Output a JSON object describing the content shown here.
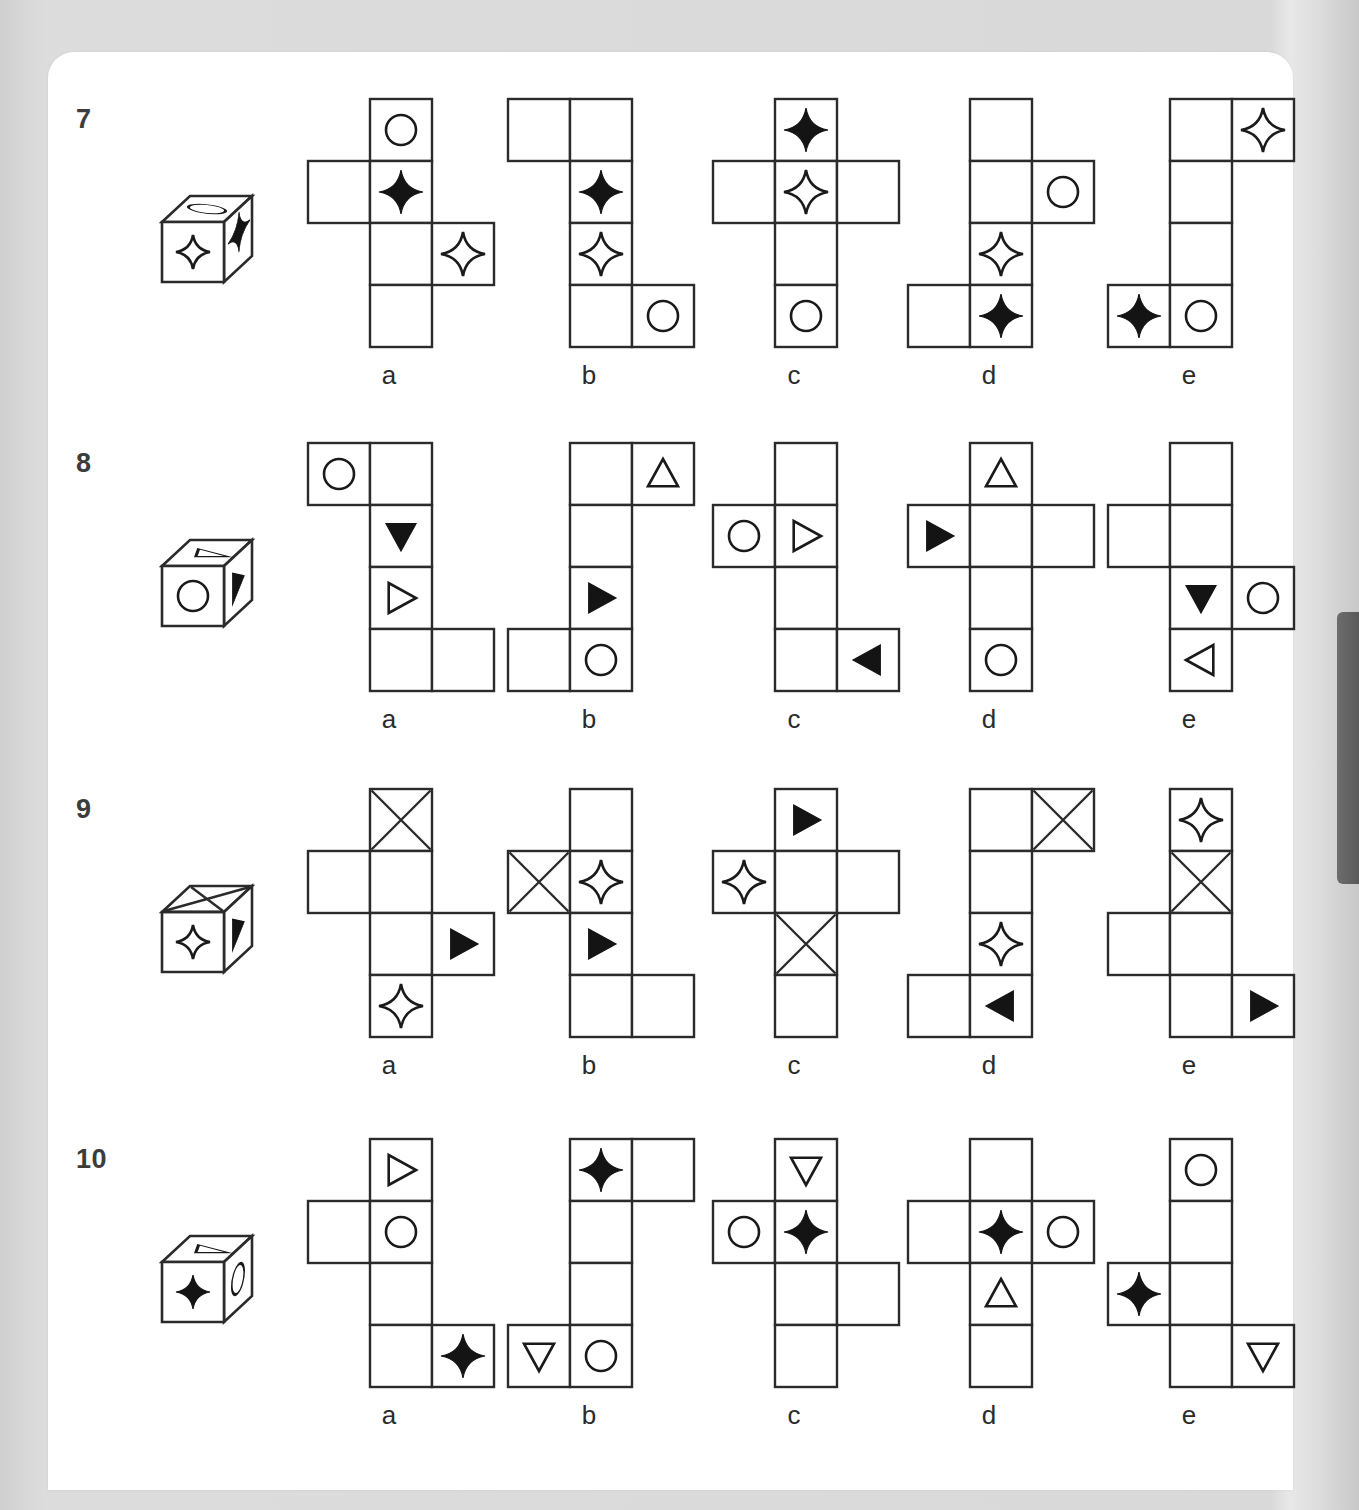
{
  "page": {
    "background_color": "#d6d6d6",
    "card_color": "#ffffff",
    "tab_color": "#636363",
    "ink_color": "#1a1a1a"
  },
  "puzzle": {
    "type": "cube-net-matching",
    "option_labels": [
      "a",
      "b",
      "c",
      "d",
      "e"
    ],
    "cell_size": 62,
    "rows": [
      {
        "number": "7",
        "cube": {
          "top_face": "circle",
          "front_face": "star-open",
          "right_face": "star-filled"
        },
        "options": [
          {
            "label": "a",
            "left_col": [
              {
                "row": 2,
                "glyph": "empty"
              }
            ],
            "mid_col": [
              "circle",
              "star-filled",
              "empty",
              "empty"
            ],
            "right_col": [
              {
                "row": 3,
                "glyph": "star-open"
              }
            ]
          },
          {
            "label": "b",
            "left_col": [
              {
                "row": 1,
                "glyph": "empty"
              }
            ],
            "mid_col": [
              "empty",
              "star-filled",
              "star-open",
              "empty"
            ],
            "right_col": [
              {
                "row": 4,
                "glyph": "circle"
              }
            ]
          },
          {
            "label": "c",
            "left_col": [
              {
                "row": 2,
                "glyph": "empty"
              }
            ],
            "mid_col": [
              "star-filled",
              "star-open",
              "empty",
              "circle"
            ],
            "right_col": [
              {
                "row": 2,
                "glyph": "empty"
              }
            ]
          },
          {
            "label": "d",
            "left_col": [
              {
                "row": 4,
                "glyph": "empty"
              }
            ],
            "mid_col": [
              "empty",
              "empty",
              "star-open",
              "star-filled"
            ],
            "right_col": [
              {
                "row": 2,
                "glyph": "circle"
              }
            ]
          },
          {
            "label": "e",
            "left_col": [
              {
                "row": 4,
                "glyph": "star-filled"
              }
            ],
            "mid_col": [
              "empty",
              "empty",
              "empty",
              "circle"
            ],
            "right_col": [
              {
                "row": 1,
                "glyph": "star-open"
              }
            ]
          }
        ]
      },
      {
        "number": "8",
        "cube": {
          "top_face": "triangle-open",
          "front_face": "circle",
          "right_face": "triangle-filled"
        },
        "options": [
          {
            "label": "a",
            "left_col": [
              {
                "row": 1,
                "glyph": "circle"
              }
            ],
            "mid_col": [
              "empty",
              "triangle-down-filled",
              "triangle-right-open",
              "empty"
            ],
            "right_col": [
              {
                "row": 4,
                "glyph": "empty"
              }
            ]
          },
          {
            "label": "b",
            "left_col": [
              {
                "row": 4,
                "glyph": "empty"
              }
            ],
            "mid_col": [
              "empty",
              "empty",
              "triangle-right-filled",
              "circle"
            ],
            "right_col": [
              {
                "row": 1,
                "glyph": "triangle-up-open"
              }
            ]
          },
          {
            "label": "c",
            "left_col": [
              {
                "row": 2,
                "glyph": "circle"
              }
            ],
            "mid_col": [
              "empty",
              "triangle-right-open",
              "empty",
              "empty"
            ],
            "right_col": [
              {
                "row": 4,
                "glyph": "triangle-left-filled"
              }
            ]
          },
          {
            "label": "d",
            "left_col": [
              {
                "row": 2,
                "glyph": "triangle-right-filled"
              }
            ],
            "mid_col": [
              "triangle-up-open",
              "empty",
              "empty",
              "circle"
            ],
            "right_col": [
              {
                "row": 2,
                "glyph": "empty"
              }
            ]
          },
          {
            "label": "e",
            "left_col": [
              {
                "row": 2,
                "glyph": "empty"
              }
            ],
            "mid_col": [
              "empty",
              "empty",
              "triangle-down-filled",
              "triangle-left-open"
            ],
            "right_col": [
              {
                "row": 3,
                "glyph": "circle"
              }
            ]
          }
        ]
      },
      {
        "number": "9",
        "cube": {
          "top_face": "x-cross",
          "front_face": "star-open",
          "right_face": "triangle-filled"
        },
        "options": [
          {
            "label": "a",
            "left_col": [
              {
                "row": 2,
                "glyph": "empty"
              }
            ],
            "mid_col": [
              "x-cross",
              "empty",
              "empty",
              "star-open"
            ],
            "right_col": [
              {
                "row": 3,
                "glyph": "triangle-right-filled"
              }
            ]
          },
          {
            "label": "b",
            "left_col": [
              {
                "row": 2,
                "glyph": "x-cross"
              }
            ],
            "mid_col": [
              "empty",
              "star-open",
              "triangle-right-filled",
              "empty"
            ],
            "right_col": [
              {
                "row": 4,
                "glyph": "empty"
              }
            ]
          },
          {
            "label": "c",
            "left_col": [
              {
                "row": 2,
                "glyph": "star-open"
              }
            ],
            "mid_col": [
              "triangle-right-filled",
              "empty",
              "x-cross",
              "empty"
            ],
            "right_col": [
              {
                "row": 2,
                "glyph": "empty"
              }
            ]
          },
          {
            "label": "d",
            "left_col": [
              {
                "row": 4,
                "glyph": "empty"
              }
            ],
            "mid_col": [
              "empty",
              "empty",
              "star-open",
              "triangle-left-filled"
            ],
            "right_col": [
              {
                "row": 1,
                "glyph": "x-cross"
              }
            ]
          },
          {
            "label": "e",
            "left_col": [
              {
                "row": 3,
                "glyph": "empty"
              }
            ],
            "mid_col": [
              "star-open",
              "x-cross",
              "empty",
              "empty"
            ],
            "right_col": [
              {
                "row": 4,
                "glyph": "triangle-right-filled"
              }
            ]
          }
        ]
      },
      {
        "number": "10",
        "cube": {
          "top_face": "triangle-open",
          "front_face": "star-filled",
          "right_face": "circle"
        },
        "options": [
          {
            "label": "a",
            "left_col": [
              {
                "row": 2,
                "glyph": "empty"
              }
            ],
            "mid_col": [
              "triangle-right-open",
              "circle",
              "empty",
              "empty"
            ],
            "right_col": [
              {
                "row": 4,
                "glyph": "star-filled"
              }
            ]
          },
          {
            "label": "b",
            "left_col": [
              {
                "row": 4,
                "glyph": "triangle-down-open"
              }
            ],
            "mid_col": [
              "star-filled",
              "empty",
              "empty",
              "circle"
            ],
            "right_col": [
              {
                "row": 1,
                "glyph": "empty"
              }
            ]
          },
          {
            "label": "c",
            "left_col": [
              {
                "row": 2,
                "glyph": "circle"
              }
            ],
            "mid_col": [
              "triangle-down-open",
              "star-filled",
              "empty",
              "empty"
            ],
            "right_col": [
              {
                "row": 3,
                "glyph": "empty"
              }
            ]
          },
          {
            "label": "d",
            "left_col": [
              {
                "row": 2,
                "glyph": "empty"
              }
            ],
            "mid_col": [
              "empty",
              "star-filled",
              "triangle-up-open",
              "empty"
            ],
            "right_col": [
              {
                "row": 2,
                "glyph": "circle"
              }
            ]
          },
          {
            "label": "e",
            "left_col": [
              {
                "row": 3,
                "glyph": "star-filled"
              }
            ],
            "mid_col": [
              "circle",
              "empty",
              "empty",
              "empty"
            ],
            "right_col": [
              {
                "row": 4,
                "glyph": "triangle-down-open"
              }
            ]
          }
        ]
      }
    ]
  },
  "layout": {
    "row_tops": [
      96,
      440,
      786,
      1136
    ],
    "num_left": 76,
    "cube_left": 148,
    "option_lefts": [
      305,
      505,
      710,
      905,
      1105
    ]
  }
}
